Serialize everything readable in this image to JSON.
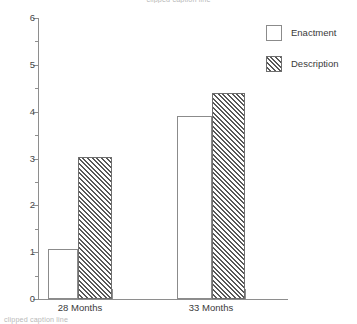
{
  "caption": {
    "top_clipped": "clipped caption line",
    "bottom_clipped": "clipped caption line"
  },
  "legend": {
    "position": "top-right",
    "items": [
      {
        "label": "Enactment",
        "fill": "none",
        "swatch": "empty-swatch"
      },
      {
        "label": "Description",
        "fill": "diagonal-hatch",
        "swatch": "hatched-swatch"
      }
    ]
  },
  "axis": {
    "y_ticks": [
      "0",
      "1",
      "2",
      "3",
      "4",
      "5",
      "6"
    ],
    "x_categories": [
      "28 Months",
      "33 Months"
    ]
  },
  "chart_data": {
    "type": "bar",
    "title": "",
    "xlabel": "",
    "ylabel": "",
    "categories": [
      "28 Months",
      "33 Months"
    ],
    "series": [
      {
        "name": "Enactment",
        "values": [
          1.06,
          3.9
        ]
      },
      {
        "name": "Description",
        "values": [
          3.03,
          4.4
        ]
      }
    ],
    "ylim": [
      0,
      6
    ],
    "ytick_step": 1,
    "yminor_step": 0.5,
    "grid": false,
    "legend_position": "top-right"
  }
}
